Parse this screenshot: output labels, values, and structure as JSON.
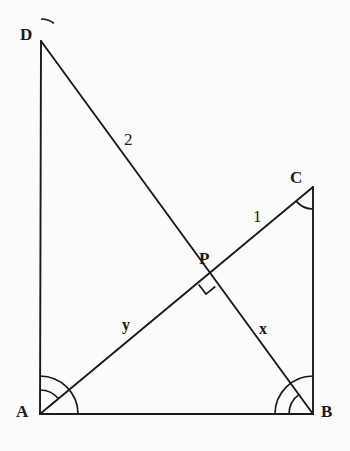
{
  "figure": {
    "background_color": "#fbfbfa",
    "stroke_color": "#1a1a1a",
    "vertices": [
      {
        "id": "D",
        "label": "D",
        "x": 41,
        "y": 41,
        "label_x": 20,
        "label_y": 26
      },
      {
        "id": "A",
        "label": "A",
        "x": 40,
        "y": 414,
        "label_x": 16,
        "label_y": 403
      },
      {
        "id": "B",
        "label": "B",
        "x": 313,
        "y": 414,
        "label_x": 321,
        "label_y": 403
      },
      {
        "id": "C",
        "label": "C",
        "x": 313,
        "y": 187,
        "label_x": 290,
        "label_y": 169
      },
      {
        "id": "P",
        "label": "P",
        "x": 208,
        "y": 277,
        "label_x": 199,
        "label_y": 250
      }
    ],
    "segments": [
      {
        "id": "AD",
        "from": "A",
        "to": "D",
        "x1": 40,
        "y1": 414,
        "x2": 41,
        "y2": 41
      },
      {
        "id": "AB",
        "from": "A",
        "to": "B",
        "x1": 40,
        "y1": 414,
        "x2": 313,
        "y2": 414
      },
      {
        "id": "BC",
        "from": "B",
        "to": "C",
        "x1": 313,
        "y1": 414,
        "x2": 313,
        "y2": 187
      },
      {
        "id": "DB",
        "from": "D",
        "to": "B",
        "x1": 41,
        "y1": 41,
        "x2": 313,
        "y2": 414
      },
      {
        "id": "AC",
        "from": "A",
        "to": "C",
        "x1": 40,
        "y1": 414,
        "x2": 313,
        "y2": 187
      }
    ],
    "segment_labels": [
      {
        "id": "label-2",
        "text": "2",
        "x": 124,
        "y": 131,
        "style": "serif",
        "segment": "DP"
      },
      {
        "id": "label-1",
        "text": "1",
        "x": 253,
        "y": 208,
        "style": "serif",
        "segment": "PC"
      },
      {
        "id": "label-y",
        "text": "y",
        "x": 122,
        "y": 317,
        "style": "bold",
        "segment": "AP"
      },
      {
        "id": "label-x",
        "text": "x",
        "x": 259,
        "y": 321,
        "style": "bold",
        "segment": "PB"
      }
    ],
    "right_angle": {
      "id": "right-angle-at-P",
      "at_vertex": "P",
      "size": 12,
      "description": "square marker below P indicating AC is perpendicular to DB"
    },
    "angle_arcs": [
      {
        "id": "arc-D",
        "vertex": "D",
        "radius": 22,
        "start_deg": 270,
        "end_deg": 306
      },
      {
        "id": "arc-A1",
        "vertex": "A",
        "radius": 24,
        "start_deg": 270,
        "end_deg": 320
      },
      {
        "id": "arc-A2",
        "vertex": "A",
        "radius": 38,
        "start_deg": 270,
        "end_deg": 360
      },
      {
        "id": "arc-B1",
        "vertex": "B",
        "radius": 24,
        "start_deg": 180,
        "end_deg": 234
      },
      {
        "id": "arc-B2",
        "vertex": "B",
        "radius": 38,
        "start_deg": 180,
        "end_deg": 270
      },
      {
        "id": "arc-C",
        "vertex": "C",
        "radius": 22,
        "start_deg": 90,
        "end_deg": 140
      }
    ]
  }
}
